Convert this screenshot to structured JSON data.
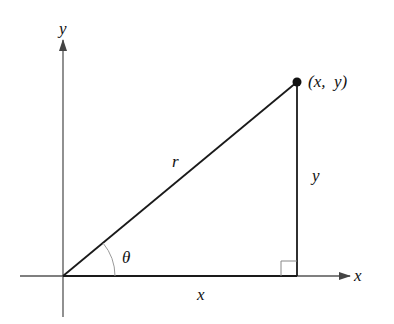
{
  "diagram": {
    "axes": {
      "x_label": "x",
      "y_label": "y"
    },
    "point_label": "(x,  y)",
    "hypotenuse_label": "r",
    "vertical_side_label": "y",
    "horizontal_side_label": "x",
    "angle_label": "θ",
    "colors": {
      "line": "#1a1a1a",
      "axis": "#555555",
      "arc": "#9a9a9a"
    }
  }
}
